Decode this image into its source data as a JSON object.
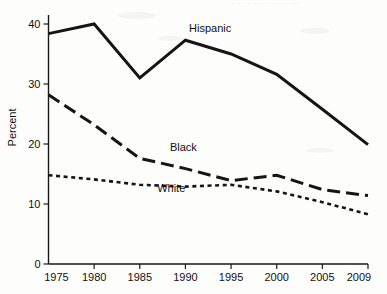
{
  "page": {
    "faint_bleed_text": "· ···· ·· ····· ········· ····"
  },
  "chart_data": {
    "type": "line",
    "title": "",
    "xlabel": "",
    "ylabel": "Percent",
    "x": [
      1975,
      1980,
      1985,
      1990,
      1995,
      2000,
      2005,
      2009
    ],
    "xtick_labels": [
      "1975",
      "1980",
      "1985",
      "1990",
      "1995",
      "2000",
      "2005",
      "2009"
    ],
    "ytick_labels": [
      "0",
      "10",
      "20",
      "30",
      "40"
    ],
    "yticks": [
      0,
      10,
      20,
      30,
      40
    ],
    "ylim": [
      0,
      41.5
    ],
    "grid": false,
    "legend_position": "inline-annotations",
    "series": [
      {
        "name": "Hispanic",
        "label": "Hispanic",
        "line_style": "solid",
        "stroke_width": 3.0,
        "color": "#151515",
        "values": [
          38.4,
          40.0,
          31.0,
          37.3,
          35.0,
          31.6,
          25.8,
          19.9
        ],
        "label_x": 1990.4,
        "label_y": 38.6
      },
      {
        "name": "Black",
        "label": "Black",
        "line_style": "long-dash",
        "stroke_width": 3.0,
        "color": "#151515",
        "values": [
          28.2,
          23.2,
          17.6,
          15.9,
          13.9,
          14.8,
          12.4,
          11.4
        ],
        "label_x": 1988.3,
        "label_y": 18.9
      },
      {
        "name": "White",
        "label": "White",
        "line_style": "short-dash",
        "stroke_width": 2.6,
        "color": "#151515",
        "values": [
          14.8,
          14.1,
          13.2,
          12.9,
          13.2,
          12.1,
          10.3,
          8.3
        ],
        "label_x": 1986.9,
        "label_y": 12.0
      }
    ]
  }
}
